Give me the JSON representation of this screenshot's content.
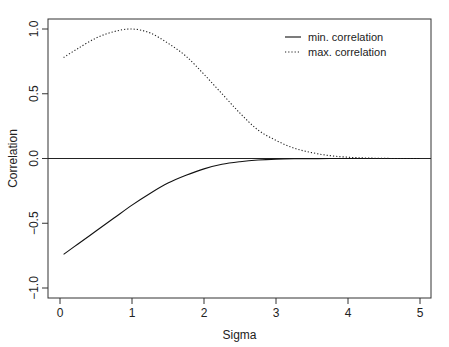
{
  "chart_data": {
    "type": "line",
    "title": "",
    "xlabel": "Sigma",
    "ylabel": "Correlation",
    "xlim": [
      -0.15,
      5.15
    ],
    "ylim": [
      -1.08,
      1.08
    ],
    "x_ticks": [
      0,
      1,
      2,
      3,
      4,
      5
    ],
    "x_tick_labels": [
      "0",
      "1",
      "2",
      "3",
      "4",
      "5"
    ],
    "y_ticks": [
      -1.0,
      -0.5,
      0.0,
      0.5,
      1.0
    ],
    "y_tick_labels": [
      "−1.0",
      "−0.5",
      "0.0",
      "0.5",
      "1.0"
    ],
    "grid": false,
    "legend_position": "top-right (inside)",
    "reference_lines": [
      {
        "type": "horizontal",
        "y": 0.0,
        "style": "solid"
      }
    ],
    "x": [
      0.05,
      0.25,
      0.5,
      0.75,
      1.0,
      1.25,
      1.5,
      1.75,
      2.0,
      2.25,
      2.5,
      2.75,
      3.0,
      3.25,
      3.5,
      3.75,
      4.0,
      4.25,
      4.5,
      4.75,
      5.0
    ],
    "series": [
      {
        "name": "min. correlation",
        "style": "solid",
        "color": "#000000",
        "values": [
          -0.74,
          -0.66,
          -0.56,
          -0.46,
          -0.36,
          -0.27,
          -0.19,
          -0.13,
          -0.08,
          -0.045,
          -0.025,
          -0.012,
          -0.005,
          -0.002,
          -0.001,
          0.0,
          0.0,
          0.0,
          0.0,
          0.0,
          0.0
        ]
      },
      {
        "name": "max. correlation",
        "style": "dotted",
        "color": "#000000",
        "values": [
          0.78,
          0.85,
          0.93,
          0.98,
          1.0,
          0.97,
          0.89,
          0.79,
          0.65,
          0.5,
          0.35,
          0.22,
          0.14,
          0.08,
          0.045,
          0.022,
          0.01,
          0.004,
          0.001,
          0.0,
          0.0
        ]
      }
    ]
  },
  "legend": {
    "items": [
      {
        "label": "min. correlation",
        "style": "solid"
      },
      {
        "label": "max. correlation",
        "style": "dotted"
      }
    ]
  }
}
